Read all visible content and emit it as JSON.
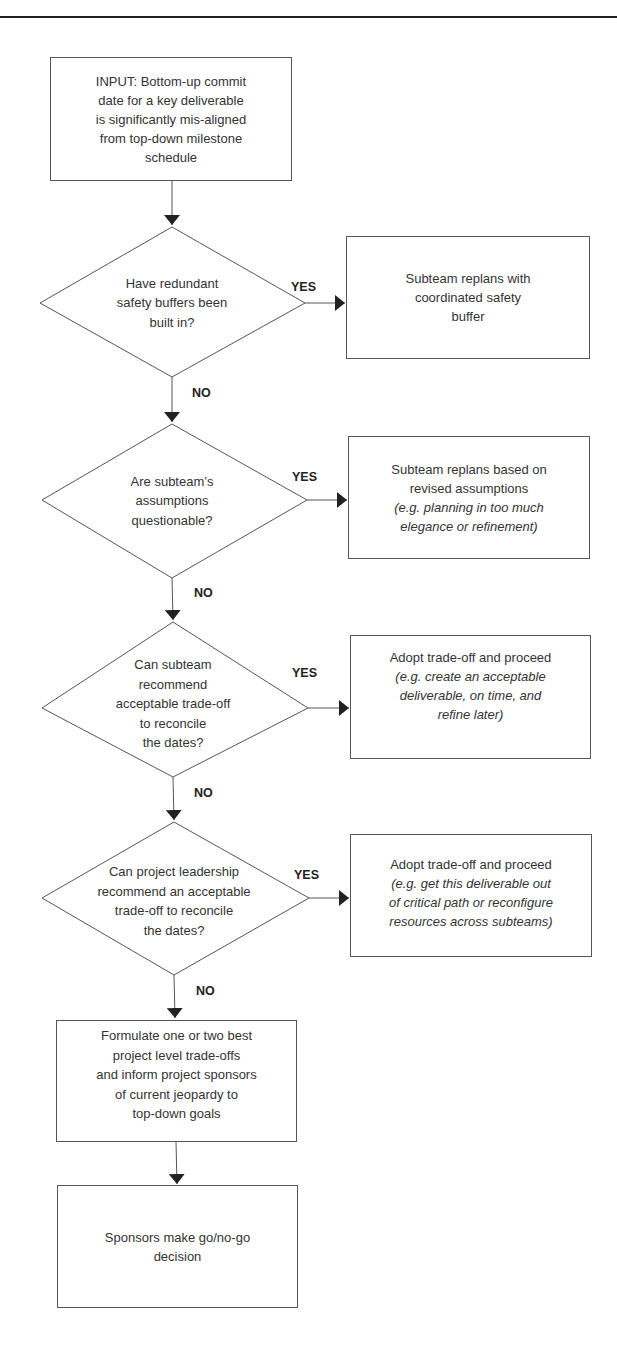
{
  "diagram": {
    "type": "flowchart",
    "input": {
      "lines": [
        "INPUT: Bottom-up commit",
        "date for a key deliverable",
        "is significantly mis-aligned",
        "from top-down milestone",
        "schedule"
      ]
    },
    "decisions": [
      {
        "question_lines": [
          "Have redundant",
          "safety buffers been",
          "built in?"
        ],
        "yes_label": "YES",
        "no_label": "NO",
        "yes_action": {
          "lines": [
            "Subteam replans with",
            "coordinated safety",
            "buffer"
          ],
          "note_lines": []
        }
      },
      {
        "question_lines": [
          "Are subteam’s",
          "assumptions",
          "questionable?"
        ],
        "yes_label": "YES",
        "no_label": "NO",
        "yes_action": {
          "lines": [
            "Subteam replans based on",
            "revised assumptions"
          ],
          "note_lines": [
            "(e.g. planning in too much",
            "elegance or refinement)"
          ]
        }
      },
      {
        "question_lines": [
          "Can subteam",
          "recommend",
          "acceptable trade-off",
          "to reconcile",
          "the dates?"
        ],
        "yes_label": "YES",
        "no_label": "NO",
        "yes_action": {
          "lines": [
            "Adopt trade-off and proceed"
          ],
          "note_lines": [
            "(e.g. create an acceptable",
            "deliverable, on time, and",
            "refine later)"
          ]
        }
      },
      {
        "question_lines": [
          "Can project leadership",
          "recommend an acceptable",
          "trade-off to reconcile",
          "the dates?"
        ],
        "yes_label": "YES",
        "no_label": "NO",
        "yes_action": {
          "lines": [
            "Adopt trade-off and proceed"
          ],
          "note_lines": [
            "(e.g. get this deliverable out",
            "of critical path or reconfigure",
            "resources across subteams)"
          ]
        }
      }
    ],
    "escalation": {
      "lines": [
        "Formulate one or two best",
        "project level trade-offs",
        "and inform project sponsors",
        "of current jeopardy to",
        "top-down goals"
      ]
    },
    "final": {
      "lines": [
        "Sponsors make go/no-go",
        "decision"
      ]
    }
  },
  "colors": {
    "line": "#555555",
    "text": "#333333",
    "arrow": "#222222"
  }
}
